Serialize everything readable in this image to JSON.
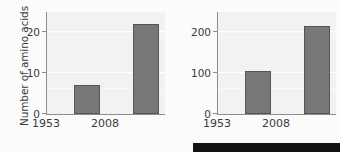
{
  "figure": {
    "background_color": "#fbfbfb",
    "plot_background_color": "#f2f2f2",
    "bar_color": "#787878",
    "bar_edge_color": "#555555",
    "axis_color": "#8d8d8d",
    "gridline_color": "#ffffff",
    "text_color": "#3a3a3a",
    "strip_color": "#111111"
  },
  "chart_data": [
    {
      "type": "bar",
      "title": "",
      "xlabel": "",
      "ylabel": "Number of amino acids",
      "categories": [
        "1953",
        "2008"
      ],
      "values": [
        7,
        22
      ],
      "ylim": [
        0,
        25
      ],
      "yticks": [
        0,
        10,
        20
      ],
      "ytick_labels": [
        "0",
        "10",
        "20"
      ],
      "grid": true,
      "legend": "none"
    },
    {
      "type": "bar",
      "title": "",
      "xlabel": "",
      "ylabel": "Mass of amino acids (mg)",
      "categories": [
        "1953",
        "2008"
      ],
      "values": [
        105,
        215
      ],
      "ylim": [
        0,
        250
      ],
      "yticks": [
        0,
        100,
        200
      ],
      "ytick_labels": [
        "0",
        "100",
        "200"
      ],
      "grid": true,
      "legend": "none"
    }
  ],
  "panels": {
    "left": {
      "ylabel": "Number of amino acids",
      "ytick_labels": [
        "0",
        "10",
        "20"
      ],
      "xtick_labels": [
        "1953",
        "2008"
      ],
      "bar_values": [
        "7",
        "22"
      ]
    },
    "right": {
      "ylabel": "Mass of amino acids (mg)",
      "ytick_labels": [
        "0",
        "100",
        "200"
      ],
      "xtick_labels": [
        "1953",
        "2008"
      ],
      "bar_values": [
        "105",
        "215"
      ]
    }
  }
}
